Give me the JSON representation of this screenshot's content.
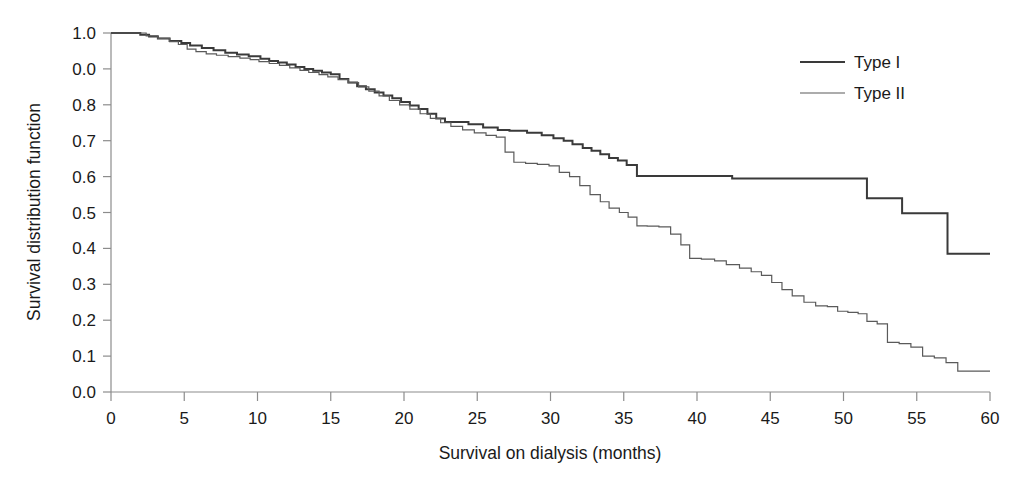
{
  "chart_data": {
    "type": "line",
    "title": "",
    "xlabel": "Survival on dialysis (months)",
    "ylabel": "Survival distribution function",
    "xlim": [
      0,
      60
    ],
    "ylim": [
      0,
      1.0
    ],
    "grid": false,
    "legend_position": "top-right",
    "xticks": [
      0,
      5,
      10,
      15,
      20,
      25,
      30,
      35,
      40,
      45,
      50,
      55,
      60
    ],
    "xtick_labels": [
      "0",
      "5",
      "10",
      "15",
      "20",
      "25",
      "30",
      "35",
      "40",
      "45",
      "50",
      "55",
      "60"
    ],
    "yticks": [
      1.0,
      0.9,
      0.8,
      0.7,
      0.6,
      0.5,
      0.4,
      0.3,
      0.2,
      0.1,
      0.0
    ],
    "ytick_labels": [
      "1.0",
      "0.0",
      "0.8",
      "0.7",
      "0.6",
      "0.5",
      "0.4",
      "0.3",
      "0.2",
      "0.1",
      "0.0"
    ],
    "series": [
      {
        "name": "Type I",
        "style": "step",
        "color": "#3a3a3a",
        "width": 2.0,
        "x": [
          0,
          1.2,
          2.0,
          2.6,
          3.2,
          4.0,
          4.8,
          5.4,
          6.2,
          7.0,
          7.8,
          8.6,
          9.4,
          10.2,
          10.8,
          11.4,
          12.0,
          12.6,
          13.2,
          13.8,
          14.4,
          15.0,
          15.6,
          16.2,
          16.8,
          17.4,
          18.0,
          18.6,
          19.2,
          19.8,
          20.4,
          21.0,
          21.6,
          22.2,
          22.8,
          24.4,
          25.4,
          26.4,
          27.2,
          28.4,
          29.4,
          30.2,
          30.9,
          31.5,
          32.2,
          32.8,
          33.4,
          34.0,
          34.6,
          35.2,
          35.9,
          42.4,
          51.6,
          54.0,
          57.1,
          60.0
        ],
        "y": [
          1.0,
          1.0,
          0.995,
          0.99,
          0.985,
          0.978,
          0.972,
          0.965,
          0.958,
          0.952,
          0.945,
          0.94,
          0.935,
          0.928,
          0.922,
          0.918,
          0.912,
          0.905,
          0.9,
          0.895,
          0.89,
          0.885,
          0.872,
          0.862,
          0.852,
          0.843,
          0.834,
          0.826,
          0.818,
          0.808,
          0.798,
          0.788,
          0.775,
          0.762,
          0.752,
          0.746,
          0.737,
          0.73,
          0.728,
          0.722,
          0.715,
          0.707,
          0.7,
          0.69,
          0.68,
          0.672,
          0.662,
          0.652,
          0.645,
          0.632,
          0.602,
          0.595,
          0.54,
          0.498,
          0.385,
          0.385
        ]
      },
      {
        "name": "Type II",
        "style": "step",
        "color": "#5a5a5a",
        "width": 1.2,
        "x": [
          0,
          1.5,
          2.4,
          3.2,
          4.0,
          4.6,
          5.2,
          5.8,
          6.5,
          7.2,
          8.0,
          8.8,
          9.5,
          10.1,
          10.8,
          11.5,
          12.2,
          12.9,
          13.5,
          14.2,
          14.8,
          15.5,
          16.2,
          16.9,
          17.6,
          18.3,
          19.0,
          19.7,
          20.4,
          21.1,
          21.8,
          22.5,
          23.2,
          24.0,
          24.8,
          25.6,
          26.3,
          26.9,
          27.5,
          28.3,
          29.1,
          29.9,
          30.6,
          31.3,
          32.0,
          32.7,
          33.4,
          34.0,
          34.7,
          35.3,
          35.9,
          36.6,
          37.4,
          38.2,
          38.9,
          39.5,
          40.3,
          41.2,
          42.0,
          42.9,
          43.7,
          44.4,
          45.1,
          45.8,
          46.5,
          47.3,
          48.1,
          48.9,
          49.6,
          50.3,
          51.0,
          51.6,
          52.3,
          53.0,
          53.8,
          54.6,
          55.4,
          56.2,
          57.0,
          57.8,
          60.0
        ],
        "y": [
          1.0,
          1.0,
          0.992,
          0.985,
          0.976,
          0.968,
          0.955,
          0.948,
          0.942,
          0.938,
          0.934,
          0.93,
          0.926,
          0.92,
          0.915,
          0.91,
          0.903,
          0.896,
          0.89,
          0.884,
          0.878,
          0.87,
          0.862,
          0.85,
          0.838,
          0.825,
          0.812,
          0.8,
          0.788,
          0.775,
          0.762,
          0.75,
          0.74,
          0.73,
          0.722,
          0.715,
          0.71,
          0.668,
          0.64,
          0.637,
          0.634,
          0.63,
          0.612,
          0.6,
          0.575,
          0.55,
          0.53,
          0.512,
          0.5,
          0.487,
          0.463,
          0.462,
          0.46,
          0.44,
          0.41,
          0.372,
          0.37,
          0.365,
          0.355,
          0.345,
          0.335,
          0.325,
          0.305,
          0.285,
          0.268,
          0.25,
          0.24,
          0.238,
          0.225,
          0.222,
          0.218,
          0.197,
          0.19,
          0.138,
          0.135,
          0.125,
          0.1,
          0.095,
          0.082,
          0.058,
          0.058
        ]
      }
    ],
    "legend": [
      {
        "label": "Type I"
      },
      {
        "label": "Type II"
      }
    ]
  }
}
